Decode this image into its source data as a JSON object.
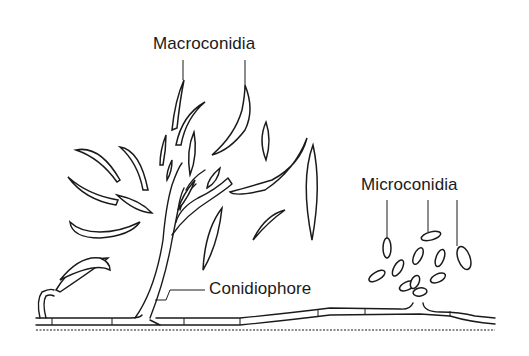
{
  "diagram": {
    "labels": {
      "macroconidia": "Macroconidia",
      "microconidia": "Microconidia",
      "conidiophore": "Conidiophore"
    },
    "colors": {
      "ink": "#1a1a1a",
      "background": "#ffffff"
    },
    "parts": [
      {
        "id": "macroconidia",
        "description": "Large curved, multi-septate spores scattered around the conidiophore",
        "leader_lines": 2
      },
      {
        "id": "microconidia",
        "description": "Small oval spores (0-1 septa) clustered on a short hyphal branch",
        "leader_lines": 3
      },
      {
        "id": "conidiophore",
        "description": "Branched stalk rising from the septate hypha bearing macroconidia",
        "leader_lines": 1
      },
      {
        "id": "hypha",
        "description": "Horizontal septate hypha along the substrate"
      }
    ]
  }
}
